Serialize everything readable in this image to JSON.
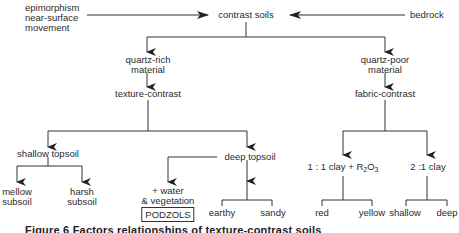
{
  "diagram": {
    "root": "contrast soils",
    "inputs_left": [
      "epimorphism",
      "near-surface",
      "movement"
    ],
    "input_right": "bedrock",
    "branch_left": {
      "material": [
        "quartz-rich",
        "material"
      ],
      "type": "texture-contrast",
      "shallow": {
        "label": "shallow topsoil",
        "children": [
          [
            "mellow",
            "subsoil"
          ],
          [
            "harsh",
            "subsoil"
          ]
        ]
      },
      "deep": {
        "label": "deep topsoil",
        "water_branch": [
          "+ water",
          "& vegetation"
        ],
        "result_box": "PODZOLS",
        "children": [
          "earthy",
          "sandy"
        ]
      }
    },
    "branch_right": {
      "material": [
        "quartz-poor",
        "material"
      ],
      "type": "fabric-contrast",
      "clay_1_1": {
        "label_prefix": "1 : 1 clay + R",
        "sub1": "2",
        "mid": "O",
        "sub2": "3",
        "children": [
          "red",
          "yellow"
        ]
      },
      "clay_2_1": {
        "label": "2 :1 clay",
        "children": [
          "shallow",
          "deep"
        ]
      }
    }
  },
  "caption": "Figure 6 Factors relationships of texture-contrast soils"
}
